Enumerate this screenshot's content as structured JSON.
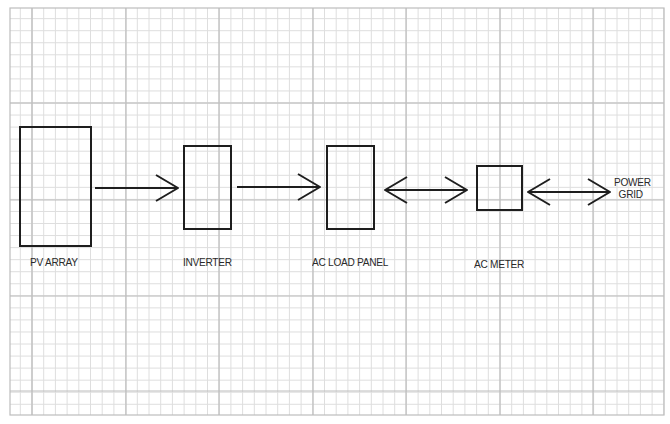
{
  "diagram": {
    "colors": {
      "background": "#ffffff",
      "grid_minor": "#dedede",
      "grid_major": "#bdbdbd",
      "ink": "#1e1e1e"
    },
    "grid": {
      "left": 10,
      "top": 8,
      "right": 664,
      "bottom": 415,
      "major_x": [
        32,
        126,
        219,
        313,
        406,
        500,
        593
      ],
      "major_y": [
        103,
        200,
        296,
        391
      ],
      "minor_step": 11.7
    },
    "nodes": [
      {
        "id": "pv-array",
        "label": "PV ARRAY",
        "x": 20,
        "y": 127,
        "w": 71,
        "h": 119,
        "label_x": 30,
        "label_y": 262
      },
      {
        "id": "inverter",
        "label": "INVERTER",
        "x": 184,
        "y": 146,
        "w": 47,
        "h": 83,
        "label_x": 183,
        "label_y": 262
      },
      {
        "id": "ac-load-panel",
        "label": "AC LOAD PANEL",
        "x": 327,
        "y": 146,
        "w": 47,
        "h": 83,
        "label_x": 312,
        "label_y": 262
      },
      {
        "id": "ac-meter",
        "label": "AC METER",
        "x": 477,
        "y": 166,
        "w": 45,
        "h": 44,
        "label_x": 474,
        "label_y": 264
      },
      {
        "id": "power-grid",
        "label_line1": "POWER",
        "label_line2": "GRID",
        "label_x": 614,
        "label_y": 179
      }
    ],
    "edges": [
      {
        "from": "pv-array",
        "to": "inverter",
        "type": "one-way",
        "x1": 95,
        "x2": 178,
        "y": 188
      },
      {
        "from": "inverter",
        "to": "ac-load-panel",
        "type": "one-way",
        "x1": 237,
        "x2": 320,
        "y": 187
      },
      {
        "from": "ac-load-panel",
        "to": "ac-meter",
        "type": "two-way",
        "x1": 385,
        "x2": 467,
        "y": 190
      },
      {
        "from": "ac-meter",
        "to": "power-grid",
        "type": "two-way",
        "x1": 528,
        "x2": 610,
        "y": 192
      }
    ]
  }
}
